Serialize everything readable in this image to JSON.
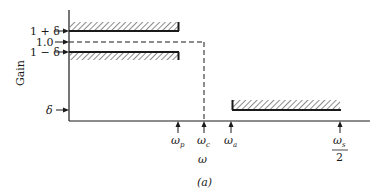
{
  "figure": {
    "caption": "(a)",
    "ylabel": "Gain",
    "xlabel": "ω",
    "y_markers": [
      {
        "label": "1 + δ",
        "y": 31
      },
      {
        "label": "1.0",
        "y": 42
      },
      {
        "label": "1 − δ",
        "y": 52
      },
      {
        "label": "δ",
        "y": 110
      }
    ],
    "x_markers": [
      {
        "label": "ω",
        "sub": "p",
        "x": 178
      },
      {
        "label": "ω",
        "sub": "c",
        "x": 204
      },
      {
        "label": "ω",
        "sub": "a",
        "x": 231
      },
      {
        "label": "ω",
        "sub": "s",
        "denominator": "2",
        "x": 340
      }
    ],
    "regions": {
      "passband_upper": "tolerance band above 1 + δ",
      "passband_lower": "tolerance band below 1 − δ",
      "stopband": "tolerance band above δ"
    },
    "ideal_response": "dashed line at 1.0 dropping at ω_c",
    "colors": {
      "ink": "#1a1a1a",
      "background": "#ffffff"
    }
  }
}
